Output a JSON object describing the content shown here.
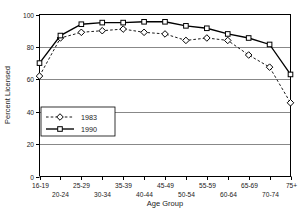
{
  "chart_data": {
    "type": "line",
    "title": "",
    "xlabel": "Age Group",
    "ylabel": "Percent Licensed",
    "categories": [
      "16-19",
      "20-24",
      "25-29",
      "30-34",
      "35-39",
      "40-44",
      "45-49",
      "50-54",
      "55-59",
      "60-64",
      "65-69",
      "70-74",
      "75+"
    ],
    "ylim": [
      0,
      100
    ],
    "yticks": [
      0,
      20,
      40,
      60,
      80,
      100
    ],
    "ytick_labels": [
      "0",
      "20",
      "40",
      "60",
      "80",
      "100"
    ],
    "grid": "horizontal",
    "legend_position": "inside-lower-left",
    "series": [
      {
        "name": "1983",
        "marker": "diamond",
        "linestyle": "dashed",
        "color": "#000000",
        "values": [
          62,
          85.5,
          89,
          90,
          91,
          89,
          88,
          84,
          85.5,
          84,
          75,
          67.5,
          45.5
        ]
      },
      {
        "name": "1990",
        "marker": "square",
        "linestyle": "solid",
        "color": "#000000",
        "values": [
          70,
          87,
          94,
          95,
          95,
          95.5,
          95.5,
          93,
          91.5,
          88,
          85.5,
          81.5,
          63
        ]
      }
    ]
  },
  "legend": {
    "entries": [
      {
        "label": "1983"
      },
      {
        "label": "1990"
      }
    ]
  }
}
